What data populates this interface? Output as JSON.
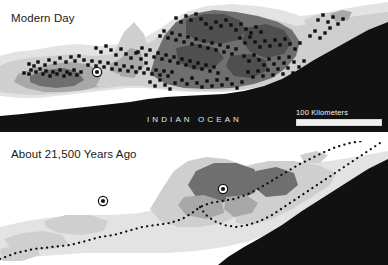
{
  "figure": {
    "kind": "two-panel-comparison-map",
    "region": "INDIAN OCEAN",
    "background_color": "#ffffff"
  },
  "palette": {
    "ocean": "#111111",
    "ocean_deep": "#0b0b0b",
    "lowland": "#f5f5f5",
    "coastal_plain": "#e3e3e3",
    "land_light": "#cfcfcf",
    "land_mid": "#a8a8a8",
    "land_dark": "#6f6f6f",
    "land_darkest": "#4f4f4f",
    "site_marker": "#101010",
    "cave_marker_ring": "#ffffff",
    "coastline_dots": "#101010",
    "label_dark": "#1a1a1a",
    "label_light": "#e8e8e8",
    "scale_rule": "#f0f0f0"
  },
  "panels": [
    {
      "id": "modern",
      "title": "Modern Day",
      "ocean_label": "INDIAN OCEAN",
      "scale": {
        "label": "100 Kilometers",
        "bar_color": "#f0f0f0"
      },
      "site_marker_count": 178,
      "cave_marker_count": 1,
      "has_submerged_coastline": false
    },
    {
      "id": "ancient",
      "title": "About 21,500 Years Ago",
      "ocean_label": "",
      "scale": {
        "label": "100 Kilometers",
        "bar_color": "#f0f0f0"
      },
      "site_marker_count": 0,
      "cave_marker_count": 2,
      "has_submerged_coastline": true,
      "coastline_style": "dotted"
    }
  ],
  "markers": {
    "modern_sites": [
      [
        24,
        73
      ],
      [
        29,
        74
      ],
      [
        31,
        70
      ],
      [
        36,
        72
      ],
      [
        40,
        69
      ],
      [
        43,
        74
      ],
      [
        46,
        71
      ],
      [
        50,
        76
      ],
      [
        53,
        72
      ],
      [
        57,
        74
      ],
      [
        60,
        70
      ],
      [
        64,
        76
      ],
      [
        67,
        72
      ],
      [
        70,
        74
      ],
      [
        74,
        70
      ],
      [
        77,
        75
      ],
      [
        81,
        72
      ],
      [
        29,
        64
      ],
      [
        34,
        66
      ],
      [
        38,
        62
      ],
      [
        45,
        65
      ],
      [
        49,
        60
      ],
      [
        55,
        63
      ],
      [
        60,
        58
      ],
      [
        66,
        62
      ],
      [
        71,
        57
      ],
      [
        75,
        61
      ],
      [
        79,
        56
      ],
      [
        84,
        60
      ],
      [
        88,
        65
      ],
      [
        92,
        61
      ],
      [
        96,
        66
      ],
      [
        100,
        62
      ],
      [
        104,
        67
      ],
      [
        108,
        63
      ],
      [
        112,
        69
      ],
      [
        116,
        64
      ],
      [
        120,
        70
      ],
      [
        124,
        66
      ],
      [
        128,
        71
      ],
      [
        132,
        67
      ],
      [
        136,
        72
      ],
      [
        140,
        68
      ],
      [
        144,
        73
      ],
      [
        148,
        69
      ],
      [
        152,
        74
      ],
      [
        156,
        70
      ],
      [
        160,
        75
      ],
      [
        164,
        71
      ],
      [
        168,
        76
      ],
      [
        172,
        72
      ],
      [
        138,
        52
      ],
      [
        142,
        48
      ],
      [
        146,
        55
      ],
      [
        150,
        50
      ],
      [
        154,
        57
      ],
      [
        158,
        53
      ],
      [
        162,
        59
      ],
      [
        166,
        55
      ],
      [
        170,
        61
      ],
      [
        174,
        57
      ],
      [
        178,
        63
      ],
      [
        182,
        59
      ],
      [
        186,
        65
      ],
      [
        190,
        61
      ],
      [
        194,
        67
      ],
      [
        198,
        63
      ],
      [
        202,
        69
      ],
      [
        206,
        65
      ],
      [
        210,
        71
      ],
      [
        214,
        67
      ],
      [
        218,
        73
      ],
      [
        160,
        36
      ],
      [
        164,
        31
      ],
      [
        168,
        38
      ],
      [
        172,
        33
      ],
      [
        176,
        40
      ],
      [
        180,
        35
      ],
      [
        184,
        42
      ],
      [
        188,
        37
      ],
      [
        192,
        44
      ],
      [
        196,
        39
      ],
      [
        200,
        46
      ],
      [
        204,
        41
      ],
      [
        208,
        48
      ],
      [
        212,
        43
      ],
      [
        216,
        50
      ],
      [
        220,
        45
      ],
      [
        224,
        52
      ],
      [
        228,
        47
      ],
      [
        232,
        54
      ],
      [
        236,
        49
      ],
      [
        176,
        18
      ],
      [
        181,
        22
      ],
      [
        186,
        16
      ],
      [
        191,
        20
      ],
      [
        196,
        14
      ],
      [
        201,
        19
      ],
      [
        206,
        24
      ],
      [
        211,
        28
      ],
      [
        216,
        22
      ],
      [
        221,
        26
      ],
      [
        226,
        20
      ],
      [
        231,
        25
      ],
      [
        236,
        30
      ],
      [
        241,
        24
      ],
      [
        246,
        29
      ],
      [
        251,
        33
      ],
      [
        256,
        27
      ],
      [
        261,
        32
      ],
      [
        240,
        38
      ],
      [
        245,
        43
      ],
      [
        250,
        37
      ],
      [
        255,
        42
      ],
      [
        260,
        47
      ],
      [
        265,
        41
      ],
      [
        270,
        46
      ],
      [
        275,
        40
      ],
      [
        280,
        45
      ],
      [
        285,
        39
      ],
      [
        290,
        44
      ],
      [
        295,
        49
      ],
      [
        300,
        43
      ],
      [
        244,
        56
      ],
      [
        249,
        61
      ],
      [
        254,
        55
      ],
      [
        259,
        60
      ],
      [
        264,
        65
      ],
      [
        269,
        59
      ],
      [
        274,
        64
      ],
      [
        279,
        58
      ],
      [
        284,
        63
      ],
      [
        289,
        57
      ],
      [
        294,
        62
      ],
      [
        299,
        67
      ],
      [
        304,
        61
      ],
      [
        248,
        72
      ],
      [
        253,
        77
      ],
      [
        258,
        71
      ],
      [
        263,
        76
      ],
      [
        268,
        70
      ],
      [
        273,
        75
      ],
      [
        278,
        69
      ],
      [
        283,
        74
      ],
      [
        288,
        68
      ],
      [
        293,
        73
      ],
      [
        298,
        78
      ],
      [
        303,
        72
      ],
      [
        308,
        77
      ],
      [
        182,
        80
      ],
      [
        187,
        84
      ],
      [
        192,
        78
      ],
      [
        197,
        83
      ],
      [
        202,
        87
      ],
      [
        207,
        81
      ],
      [
        212,
        86
      ],
      [
        217,
        80
      ],
      [
        222,
        85
      ],
      [
        227,
        79
      ],
      [
        232,
        84
      ],
      [
        237,
        88
      ],
      [
        242,
        82
      ],
      [
        150,
        82
      ],
      [
        155,
        86
      ],
      [
        160,
        80
      ],
      [
        165,
        85
      ],
      [
        170,
        89
      ],
      [
        175,
        83
      ],
      [
        318,
        20
      ],
      [
        323,
        15
      ],
      [
        328,
        22
      ],
      [
        333,
        17
      ],
      [
        338,
        24
      ],
      [
        343,
        19
      ],
      [
        310,
        36
      ],
      [
        315,
        31
      ],
      [
        320,
        38
      ],
      [
        325,
        33
      ],
      [
        330,
        28
      ],
      [
        96,
        48
      ],
      [
        101,
        52
      ],
      [
        106,
        46
      ],
      [
        111,
        50
      ],
      [
        116,
        55
      ],
      [
        121,
        49
      ],
      [
        126,
        54
      ],
      [
        131,
        58
      ],
      [
        136,
        53
      ],
      [
        141,
        59
      ],
      [
        146,
        63
      ]
    ],
    "modern_caves": [
      [
        97,
        72
      ]
    ],
    "ancient_caves": [
      [
        103,
        60
      ],
      [
        223,
        48
      ]
    ]
  }
}
